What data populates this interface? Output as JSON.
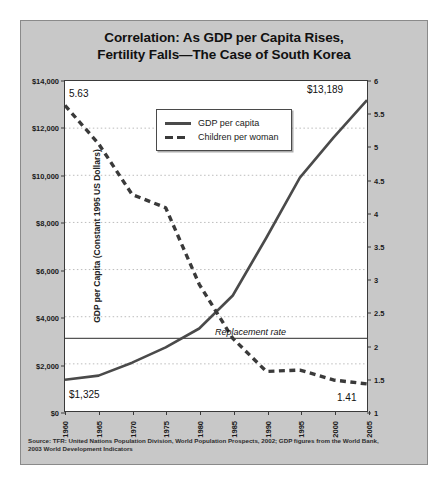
{
  "title": {
    "line1": "Correlation: As GDP per Capita Rises,",
    "line2": "Fertility Falls—The Case of South Korea"
  },
  "source": {
    "line1": "Source: TFR: United Nations Population Division, World Population Prospects, 2002; GDP figures from the World Bank,",
    "line2": "2003 World Development Indicators"
  },
  "legend": {
    "gdp_label": "GDP per capita",
    "fertility_label": "Children per woman"
  },
  "annotations": {
    "fertility_start": "5.63",
    "fertility_end": "1.41",
    "gdp_start": "$1,325",
    "gdp_end": "$13,189",
    "replacement_rate": "Replacement rate"
  },
  "colors": {
    "panel_background": "#c8c8c8",
    "plot_background": "#ffffff",
    "gdp_line": "#4a4a4a",
    "fertility_line": "#3a3a3a",
    "gridline": "#bbbbbb",
    "axis": "#3a3a3a",
    "text": "#111111"
  },
  "chart_data": {
    "type": "line",
    "title": "Correlation: As GDP per Capita Rises, Fertility Falls—The Case of South Korea",
    "xlabel": "",
    "ylabel": "GDP per Capita (Constant 1995 US Dollars)",
    "y2label": "Children per Woman",
    "xlim": [
      1960,
      2005
    ],
    "ylim": [
      0,
      14000
    ],
    "y2lim": [
      1,
      6
    ],
    "grid": true,
    "legend_position": "top-center",
    "xticks": [
      "1960",
      "1965",
      "1970",
      "1975",
      "1980",
      "1985",
      "1990",
      "1995",
      "2000",
      "2005"
    ],
    "yticks_left": [
      "$0",
      "$2,000",
      "$4,000",
      "$6,000",
      "$8,000",
      "$10,000",
      "$12,000",
      "$14,000"
    ],
    "ytick_values_left": [
      0,
      2000,
      4000,
      6000,
      8000,
      10000,
      12000,
      14000
    ],
    "yticks_right": [
      "1",
      "1.5",
      "2",
      "2.5",
      "3",
      "3.5",
      "4",
      "4.5",
      "5",
      "5.5",
      "6"
    ],
    "ytick_values_right": [
      1,
      1.5,
      2,
      2.5,
      3,
      3.5,
      4,
      4.5,
      5,
      5.5,
      6
    ],
    "reference_line": {
      "label": "Replacement rate",
      "axis": "right",
      "value": 2.1
    },
    "x": [
      1960,
      1965,
      1970,
      1975,
      1980,
      1985,
      1990,
      1995,
      2000,
      2005
    ],
    "series": [
      {
        "name": "GDP per capita",
        "axis": "left",
        "style": "solid",
        "values": [
          1325,
          1500,
          2050,
          2700,
          3500,
          4900,
          7350,
          9900,
          11600,
          13189
        ]
      },
      {
        "name": "Children per woman",
        "axis": "right",
        "style": "dashed",
        "values": [
          5.63,
          5.05,
          4.28,
          4.08,
          2.92,
          2.1,
          1.6,
          1.62,
          1.47,
          1.41
        ]
      }
    ]
  }
}
